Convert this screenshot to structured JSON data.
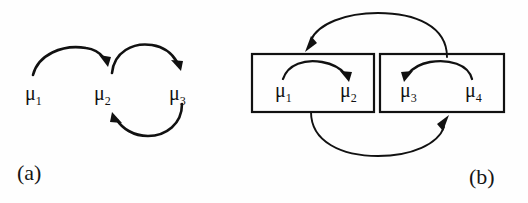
{
  "figure": {
    "name": "markov-chain-transition-diagram",
    "background_color": "#fefefe",
    "ink_color": "#111111",
    "panels": [
      {
        "id": "a",
        "label": "(a)",
        "nodes": [
          {
            "id": "mu1",
            "base": "μ",
            "sub": "1"
          },
          {
            "id": "mu2",
            "base": "μ",
            "sub": "2"
          },
          {
            "id": "mu3",
            "base": "μ",
            "sub": "3"
          }
        ],
        "edges": [
          {
            "from": "mu1",
            "to": "mu2",
            "style": "arc-above"
          },
          {
            "from": "mu2",
            "to": "mu3",
            "style": "arc-above"
          },
          {
            "from": "mu3",
            "to": "mu2",
            "style": "arc-below"
          }
        ]
      },
      {
        "id": "b",
        "label": "(b)",
        "groups": [
          {
            "id": "group-left",
            "nodes": [
              {
                "id": "mu1",
                "base": "μ",
                "sub": "1"
              },
              {
                "id": "mu2",
                "base": "μ",
                "sub": "2"
              }
            ],
            "edges": [
              {
                "from": "mu1",
                "to": "mu2",
                "style": "arc-above"
              }
            ]
          },
          {
            "id": "group-right",
            "nodes": [
              {
                "id": "mu3",
                "base": "μ",
                "sub": "3"
              },
              {
                "id": "mu4",
                "base": "μ",
                "sub": "4"
              }
            ],
            "edges": [
              {
                "from": "mu4",
                "to": "mu3",
                "style": "arc-above"
              }
            ]
          }
        ],
        "edges": [
          {
            "from": "group-right",
            "to": "group-left",
            "style": "arc-over-top"
          },
          {
            "from": "group-left",
            "to": "group-right",
            "style": "arc-under-bottom"
          }
        ]
      }
    ]
  },
  "labels": {
    "panel_a": "(a)",
    "panel_b": "(b)",
    "a_mu1": "μ",
    "a_mu1_sub": "1",
    "a_mu2": "μ",
    "a_mu2_sub": "2",
    "a_mu3": "μ",
    "a_mu3_sub": "3",
    "b_mu1": "μ",
    "b_mu1_sub": "1",
    "b_mu2": "μ",
    "b_mu2_sub": "2",
    "b_mu3": "μ",
    "b_mu3_sub": "3",
    "b_mu4": "μ",
    "b_mu4_sub": "4"
  }
}
